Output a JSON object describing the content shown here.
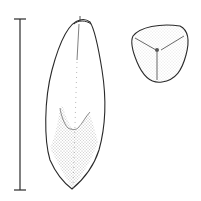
{
  "figure": {
    "views": [
      "side-view",
      "cross-section-view"
    ],
    "scale_bar": {
      "label": ""
    },
    "colors": {
      "line": "#2a2a2a",
      "stipple": "#555555",
      "background": "#ffffff"
    }
  }
}
